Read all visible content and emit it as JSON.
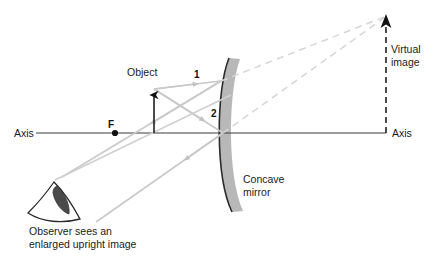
{
  "diagram": {
    "labels": {
      "axis_left": "Axis",
      "axis_right": "Axis",
      "focal_point": "F",
      "object": "Object",
      "ray_one": "1",
      "ray_two": "2",
      "mirror_line1": "Concave",
      "mirror_line2": "mirror",
      "virtual_line1": "Virtual",
      "virtual_line2": "image",
      "caption_line1": "Observer sees an",
      "caption_line2": "enlarged upright image"
    },
    "colors": {
      "axis": "#3a3a3a",
      "ray": "#c9c9c9",
      "ray_dashed": "#d6d6d6",
      "mirror_face": "#2b2b2b",
      "mirror_body": "#b8b8b8",
      "object_arrow": "#111111",
      "image_arrow": "#111111",
      "eye_outline": "#2b2b2b",
      "pupil": "#4a4a4a",
      "text": "#1a1a1a",
      "background": "#ffffff"
    },
    "geometry": {
      "axis_y": 133,
      "axis_x_start": 36,
      "axis_x_end": 386,
      "focal_point_x": 115,
      "object_x": 154,
      "object_top_y": 89,
      "mirror_vertex_x": 223,
      "image_x": 386,
      "image_top_y": 14
    }
  }
}
